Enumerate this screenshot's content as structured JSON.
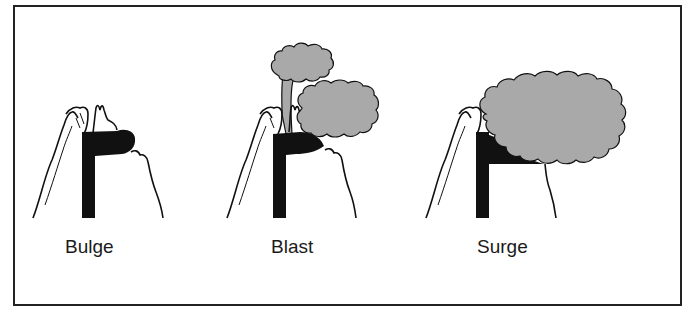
{
  "diagram": {
    "panels": [
      {
        "id": "bulge",
        "label": "Bulge"
      },
      {
        "id": "blast",
        "label": "Blast"
      },
      {
        "id": "surge",
        "label": "Surge"
      }
    ],
    "colors": {
      "frame": "#222222",
      "conduit": "#111111",
      "ash_cloud": "#a9a9a9",
      "outline": "#111111",
      "background": "#ffffff"
    }
  }
}
